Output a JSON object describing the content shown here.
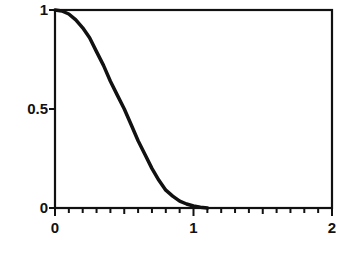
{
  "chart_data": {
    "type": "line",
    "title": "",
    "xlabel": "",
    "ylabel": "",
    "xlim": [
      0,
      2
    ],
    "ylim": [
      0,
      1
    ],
    "grid": false,
    "legend": null,
    "x_ticks": [
      {
        "value": 0,
        "label": "0"
      },
      {
        "value": 1,
        "label": "1"
      },
      {
        "value": 2,
        "label": "2"
      }
    ],
    "x_minor_tick_step": 0.1,
    "y_ticks": [
      {
        "value": 0,
        "label": "0"
      },
      {
        "value": 0.5,
        "label": "0.5"
      },
      {
        "value": 1,
        "label": "1"
      }
    ],
    "series": [
      {
        "name": "curve",
        "color": "#111111",
        "x": [
          0,
          0.05,
          0.1,
          0.15,
          0.2,
          0.25,
          0.3,
          0.35,
          0.4,
          0.45,
          0.5,
          0.55,
          0.6,
          0.65,
          0.7,
          0.75,
          0.8,
          0.85,
          0.9,
          0.95,
          1.0,
          1.05,
          1.1
        ],
        "y": [
          1.0,
          0.995,
          0.98,
          0.95,
          0.91,
          0.86,
          0.79,
          0.72,
          0.64,
          0.57,
          0.5,
          0.42,
          0.34,
          0.27,
          0.2,
          0.14,
          0.09,
          0.06,
          0.035,
          0.02,
          0.01,
          0.004,
          0.0
        ]
      }
    ]
  },
  "plot": {
    "frame_color": "#111111",
    "background": "#ffffff"
  }
}
